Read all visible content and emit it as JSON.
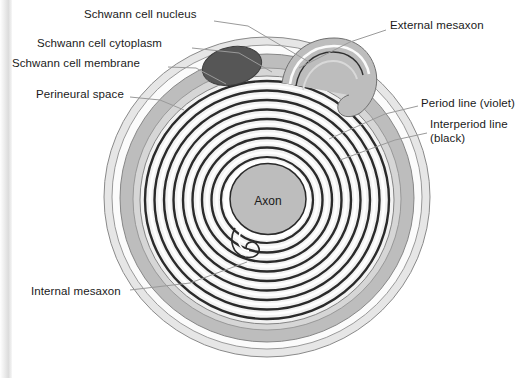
{
  "figure": {
    "background_color": "#ffffff"
  },
  "colors": {
    "perineural_space": "#e4e4e4",
    "schwann_cytoplasm": "#b9b9b9",
    "schwann_membrane": "#ffffff",
    "nucleus": "#555555",
    "axon": "#b9b9b9",
    "myelin_dark_line": "#2b2b2b",
    "myelin_light_line": "#f4f4f4",
    "outline": "#6e6e6e",
    "leader_line": "#9a9a9a",
    "label_text": "#1a1a1a"
  },
  "labels": [
    {
      "id": "schwann-cell-nucleus",
      "text": "Schwann cell nucleus",
      "side": "left",
      "x": 84,
      "y": 8,
      "leader": [
        [
          214,
          21
        ],
        [
          248,
          26
        ],
        [
          309,
          62
        ]
      ]
    },
    {
      "id": "schwann-cell-cytoplasm",
      "text": "Schwann cell cytoplasm",
      "side": "left",
      "x": 37,
      "y": 37,
      "leader": [
        [
          192,
          48
        ],
        [
          239,
          53
        ],
        [
          272,
          72
        ]
      ]
    },
    {
      "id": "schwann-cell-membrane",
      "text": "Schwann cell membrane",
      "side": "left",
      "x": 12,
      "y": 57,
      "leader": [
        [
          168,
          67
        ],
        [
          196,
          68
        ],
        [
          226,
          84
        ]
      ]
    },
    {
      "id": "perineural-space",
      "text": "Perineural space",
      "side": "left",
      "x": 36,
      "y": 88,
      "leader": [
        [
          130,
          97
        ],
        [
          160,
          100
        ],
        [
          184,
          110
        ]
      ]
    },
    {
      "id": "external-mesaxon",
      "text": "External mesaxon",
      "side": "right",
      "x": 390,
      "y": 19,
      "leader": [
        [
          386,
          30
        ],
        [
          350,
          42
        ],
        [
          299,
          68
        ]
      ]
    },
    {
      "id": "period-line-violet",
      "text": "Period line (violet)",
      "side": "right",
      "x": 421,
      "y": 97,
      "leader": [
        [
          418,
          106
        ],
        [
          385,
          114
        ],
        [
          329,
          139
        ]
      ]
    },
    {
      "id": "interperiod-line",
      "text": "Interperiod line",
      "side": "right",
      "x": 430,
      "y": 118,
      "leader": [
        [
          427,
          133
        ],
        [
          395,
          140
        ],
        [
          340,
          160
        ]
      ]
    },
    {
      "id": "interperiod-line-black",
      "text": "(black)",
      "side": "right",
      "x": 430,
      "y": 132,
      "leader": []
    },
    {
      "id": "internal-mesaxon",
      "text": "Internal mesaxon",
      "side": "left",
      "x": 31,
      "y": 285,
      "leader": [
        [
          130,
          290
        ],
        [
          190,
          283
        ],
        [
          247,
          262
        ]
      ]
    }
  ],
  "structures": {
    "axon_label": "Axon",
    "axon_label_x": 268,
    "axon_label_y": 201,
    "myelin_lamella_count": 9,
    "nucleus_shape": "ellipse"
  }
}
